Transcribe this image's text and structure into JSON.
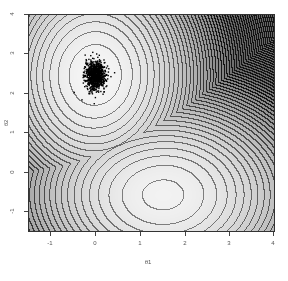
{
  "chart_data": {
    "type": "contour",
    "title": "",
    "xlabel": "θ1",
    "ylabel": "θ2",
    "xlim": [
      -1.5,
      4.0
    ],
    "ylim": [
      -1.5,
      4.0
    ],
    "x_ticks": [
      "-1",
      "0",
      "1",
      "2",
      "3",
      "4"
    ],
    "y_ticks": [
      "-1",
      "0",
      "1",
      "2",
      "3",
      "4"
    ],
    "grid": false,
    "colormap": "grayscale (light = low, dark = high)",
    "minima": [
      {
        "x": 0.0,
        "y": 2.45,
        "label": "400"
      },
      {
        "x": 1.5,
        "y": -0.55,
        "label": "800"
      }
    ],
    "contour_labels_visible": [
      "400",
      "800",
      "1200",
      "1600",
      "2000"
    ],
    "scatter_cloud": {
      "center_x": 0.0,
      "center_y": 2.45,
      "spread_x": 0.2,
      "spread_y": 0.32,
      "n_points": 900,
      "color": "#000000"
    }
  },
  "axes": {
    "xlabel": "θ1",
    "ylabel": "θ2",
    "x_tick_labels": [
      "-1",
      "0",
      "1",
      "2",
      "3",
      "4"
    ],
    "y_tick_labels": [
      "-1",
      "0",
      "1",
      "2",
      "3",
      "4"
    ]
  }
}
